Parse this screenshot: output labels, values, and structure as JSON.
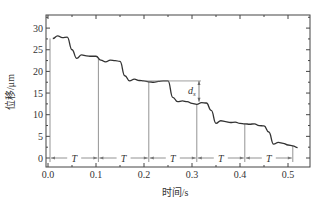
{
  "chart_data": {
    "type": "line",
    "title": "",
    "xlabel": "时间/s",
    "ylabel": "位移/μm",
    "xlim": [
      0.0,
      0.55
    ],
    "ylim": [
      -2.5,
      32.5
    ],
    "x_ticks": [
      "0.0",
      "0.1",
      "0.2",
      "0.3",
      "0.4",
      "0.5"
    ],
    "y_ticks": [
      "0",
      "5",
      "10",
      "15",
      "20",
      "25",
      "30"
    ],
    "grid": false,
    "legend": null,
    "series": [
      {
        "name": "displacement",
        "x": [
          0.01,
          0.02,
          0.03,
          0.04,
          0.05,
          0.06,
          0.07,
          0.08,
          0.09,
          0.1,
          0.11,
          0.12,
          0.13,
          0.14,
          0.15,
          0.16,
          0.17,
          0.18,
          0.19,
          0.2,
          0.21,
          0.22,
          0.23,
          0.24,
          0.25,
          0.26,
          0.27,
          0.28,
          0.29,
          0.3,
          0.31,
          0.32,
          0.33,
          0.34,
          0.35,
          0.36,
          0.37,
          0.38,
          0.39,
          0.4,
          0.41,
          0.42,
          0.43,
          0.44,
          0.45,
          0.46,
          0.47,
          0.48,
          0.49,
          0.5,
          0.51,
          0.52
        ],
        "values": [
          27.6,
          28.2,
          27.8,
          27.9,
          25.0,
          23.0,
          23.8,
          23.6,
          23.5,
          23.5,
          22.6,
          22.2,
          22.6,
          22.5,
          22.3,
          19.0,
          17.8,
          18.2,
          17.9,
          17.8,
          17.6,
          17.5,
          17.7,
          17.8,
          17.8,
          14.0,
          13.0,
          13.2,
          13.0,
          12.6,
          12.4,
          12.8,
          12.7,
          11.0,
          8.0,
          8.6,
          8.4,
          8.2,
          8.3,
          8.0,
          7.9,
          7.8,
          7.9,
          7.5,
          7.4,
          6.0,
          3.2,
          3.6,
          3.4,
          3.0,
          2.8,
          2.4
        ]
      }
    ],
    "annotations": {
      "period_label": "T",
      "period_markers_x": [
        0.0,
        0.105,
        0.21,
        0.31,
        0.41,
        0.51
      ],
      "period_count": 5,
      "step_label": "d",
      "step_subscript": "s",
      "step_reference_y": 17.8,
      "step_bottom_y": 13.0,
      "step_x": 0.3
    }
  }
}
